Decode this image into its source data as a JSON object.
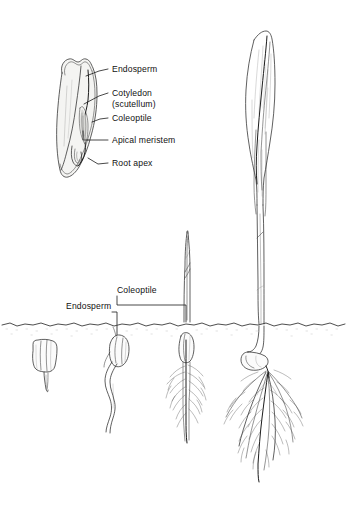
{
  "figure": {
    "background_color": "#ffffff",
    "ink_color": "#2b2b2b",
    "width": 347,
    "height": 529
  },
  "seed_diagram": {
    "name": "cutaway-grain-longitudinal-section",
    "labels": [
      {
        "id": "endosperm",
        "text": "Endosperm",
        "text_x": 112,
        "text_y": 72,
        "leader_from_x": 108,
        "leader_from_y": 69,
        "leader_to_x": 86,
        "leader_to_y": 76
      },
      {
        "id": "cotyledon",
        "text": "Cotyledon",
        "text_x": 112,
        "text_y": 96,
        "leader_from_x": 108,
        "leader_from_y": 93,
        "leader_to_x": 84,
        "leader_to_y": 104
      },
      {
        "id": "cotyledon_sub",
        "text": "(scutellum)",
        "text_x": 112,
        "text_y": 107,
        "leader_from_x": null,
        "leader_from_y": null,
        "leader_to_x": null,
        "leader_to_y": null
      },
      {
        "id": "coleoptile",
        "text": "Coleoptile",
        "text_x": 112,
        "text_y": 121,
        "leader_from_x": 108,
        "leader_from_y": 118,
        "leader_to_x": 92,
        "leader_to_y": 122
      },
      {
        "id": "apical_meristem",
        "text": "Apical meristem",
        "text_x": 112,
        "text_y": 143,
        "leader_from_x": 108,
        "leader_from_y": 140,
        "leader_to_x": 88,
        "leader_to_y": 140
      },
      {
        "id": "root_apex",
        "text": "Root apex",
        "text_x": 112,
        "text_y": 166,
        "leader_from_x": 108,
        "leader_from_y": 163,
        "leader_to_x": 88,
        "leader_to_y": 158
      }
    ]
  },
  "germination_series": {
    "soil_label": "ground-line",
    "soil_y": 324,
    "stages": [
      {
        "id": "stage-1-imbibed-seed",
        "order": 1,
        "center_x": 44,
        "description": "seed with emerging radicle"
      },
      {
        "id": "stage-2-radicle-elongating",
        "order": 2,
        "center_x": 118,
        "description": "seed with curved elongating primary root"
      },
      {
        "id": "stage-3-coleoptile-emerged",
        "order": 3,
        "center_x": 187,
        "description": "coleoptile shoot above soil, fibrous roots below"
      },
      {
        "id": "stage-4-first-leaf",
        "order": 4,
        "center_x": 265,
        "description": "first foliage leaf emerging from coleoptile, extensive fibrous root system"
      }
    ],
    "labels": [
      {
        "id": "coleoptile_field",
        "text": "Coleoptile",
        "text_x": 117,
        "text_y": 293,
        "leader_path": "M 117 296 L 117 304 L 186 304 L 186 322"
      },
      {
        "id": "endosperm_field",
        "text": "Endosperm",
        "text_x": 66,
        "text_y": 309,
        "leader_path": "M 110 312 L 117 312 L 117 334"
      }
    ]
  }
}
